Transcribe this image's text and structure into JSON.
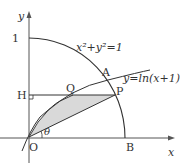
{
  "labels": {
    "y_axis": "y",
    "x_axis": "x",
    "one": "1",
    "circle_eq": "x²+y²=1",
    "curve_eq": "y=ln(x+1)",
    "A": "A",
    "B": "B",
    "H": "H",
    "O": "O",
    "P": "P",
    "Q": "Q",
    "theta": "θ"
  },
  "colors": {
    "stroke": "#333333",
    "axis": "#555555",
    "shade": "#d9d9d9"
  }
}
